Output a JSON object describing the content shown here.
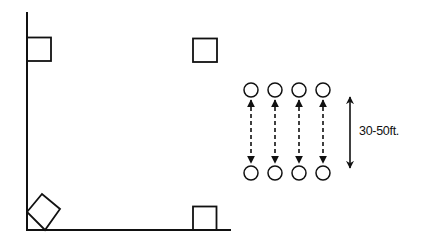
{
  "diagram": {
    "stroke_color": "#111111",
    "background": "#ffffff",
    "field": {
      "sideline": {
        "x": 27,
        "y1": 12,
        "y2": 230
      },
      "endline": {
        "y": 230,
        "x1": 27,
        "x2": 230
      }
    },
    "markers": [
      {
        "name": "top-left-marker",
        "shape": "square",
        "x": 27,
        "y": 37,
        "size": 24
      },
      {
        "name": "top-right-marker",
        "shape": "square",
        "x": 193,
        "y": 38,
        "size": 24
      },
      {
        "name": "bottom-right-marker",
        "shape": "square",
        "x": 193,
        "y": 206,
        "size": 24
      },
      {
        "name": "corner-marker",
        "shape": "rotated-square",
        "points": [
          [
            27,
            212
          ],
          [
            42,
            194
          ],
          [
            60,
            209
          ],
          [
            45,
            230
          ]
        ]
      }
    ],
    "players": {
      "top_row": [
        {
          "cx": 251,
          "cy": 90
        },
        {
          "cx": 275,
          "cy": 90
        },
        {
          "cx": 299,
          "cy": 90
        },
        {
          "cx": 323,
          "cy": 90
        }
      ],
      "bottom_row": [
        {
          "cx": 251,
          "cy": 173
        },
        {
          "cx": 275,
          "cy": 173
        },
        {
          "cx": 299,
          "cy": 173
        },
        {
          "cx": 323,
          "cy": 173
        }
      ],
      "radius": 7
    },
    "distance_arrow": {
      "x": 350,
      "y1": 97,
      "y2": 168
    },
    "distance_label": "30-50ft."
  }
}
